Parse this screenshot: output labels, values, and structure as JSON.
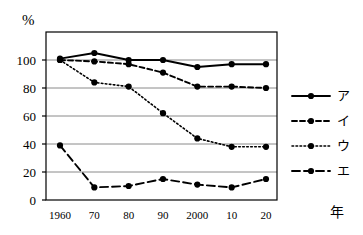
{
  "chart_data": {
    "type": "line",
    "title": "",
    "xlabel": "年",
    "ylabel": "%",
    "x": [
      1960,
      1970,
      1980,
      1990,
      2000,
      2010,
      2020
    ],
    "xtick_labels": [
      "1960",
      "70",
      "80",
      "90",
      "2000",
      "10",
      "20"
    ],
    "ytick_labels": [
      "0",
      "20",
      "40",
      "60",
      "80",
      "100"
    ],
    "yticks": [
      0,
      20,
      40,
      60,
      80,
      100
    ],
    "ylim": [
      0,
      120
    ],
    "grid": true,
    "grid_axis": "y",
    "legend_position": "right",
    "series": [
      {
        "name": "ア",
        "linestyle": "solid",
        "marker": "circle",
        "color": "#000000",
        "values": [
          101,
          105,
          100,
          100,
          95,
          97,
          97
        ]
      },
      {
        "name": "イ",
        "linestyle": "dashed",
        "marker": "circle",
        "color": "#000000",
        "values": [
          100,
          99,
          97,
          91,
          81,
          81,
          80
        ]
      },
      {
        "name": "ウ",
        "linestyle": "dotted",
        "marker": "circle",
        "color": "#000000",
        "values": [
          100,
          84,
          81,
          62,
          44,
          38,
          38
        ]
      },
      {
        "name": "エ",
        "linestyle": "longdash",
        "marker": "circle",
        "color": "#000000",
        "values": [
          39,
          9,
          10,
          15,
          11,
          9,
          15
        ]
      }
    ]
  },
  "axes": {
    "y_unit": "%",
    "x_unit": "年"
  },
  "legend": {
    "entries": [
      {
        "label": "ア",
        "style": "solid"
      },
      {
        "label": "イ",
        "style": "dashed"
      },
      {
        "label": "ウ",
        "style": "dotted"
      },
      {
        "label": "エ",
        "style": "longdash"
      }
    ]
  },
  "colors": {
    "line": "#000000",
    "grid": "#8a8a8a",
    "frame": "#000000",
    "background": "#ffffff"
  }
}
